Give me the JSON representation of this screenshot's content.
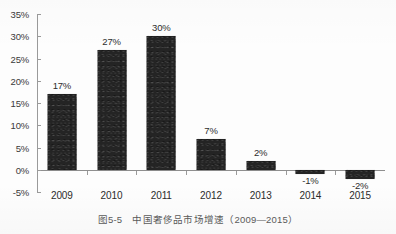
{
  "chart_data": {
    "type": "bar",
    "title": "",
    "xlabel": "",
    "ylabel": "",
    "categories": [
      "2009",
      "2010",
      "2011",
      "2012",
      "2013",
      "2014",
      "2015"
    ],
    "values": [
      17,
      27,
      30,
      7,
      2,
      -1,
      -2
    ],
    "data_labels": [
      "17%",
      "27%",
      "30%",
      "7%",
      "2%",
      "-1%",
      "-2%"
    ],
    "ylim": [
      -5,
      35
    ],
    "ytick_values": [
      35,
      30,
      25,
      20,
      15,
      10,
      5,
      0,
      -5
    ],
    "ytick_labels": [
      "35%",
      "30%",
      "25%",
      "20%",
      "15%",
      "10%",
      "5%",
      "0%",
      "-5%"
    ],
    "grid": false,
    "legend": null,
    "bar_color": "#242424",
    "axis_color": "#9a9a9a",
    "text_color": "#2d2d2d",
    "series": [
      {
        "name": "中国奢侈品市场增速",
        "values": [
          17,
          27,
          30,
          7,
          2,
          -1,
          -2
        ]
      }
    ]
  },
  "caption": {
    "text": "图5-5　中国奢侈品市场增速（2009—2015）"
  }
}
